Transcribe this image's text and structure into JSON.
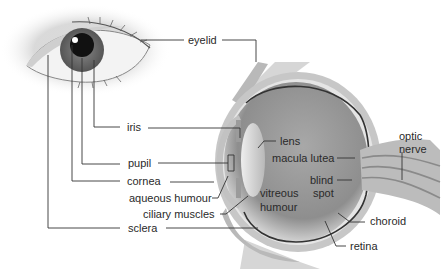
{
  "diagram": {
    "labels": {
      "eyelid": "eyelid",
      "iris": "iris",
      "pupil": "pupil",
      "cornea": "cornea",
      "aqueous_humour": "aqueous humour",
      "ciliary_muscles": "ciliary muscles",
      "sclera": "sclera",
      "lens": "lens",
      "macula_lutea": "macula lutea",
      "blind_spot_1": "blind",
      "blind_spot_2": "spot",
      "vitreous_humour_1": "vitreous",
      "vitreous_humour_2": "humour",
      "optic_nerve_1": "optic",
      "optic_nerve_2": "nerve",
      "choroid": "choroid",
      "retina": "retina"
    },
    "colors": {
      "line": "#333333",
      "eyeball": "#9a9a9a",
      "sclera_band": "#c4c4c4",
      "lens": "#d8d8d8",
      "retina": "#333333"
    }
  }
}
